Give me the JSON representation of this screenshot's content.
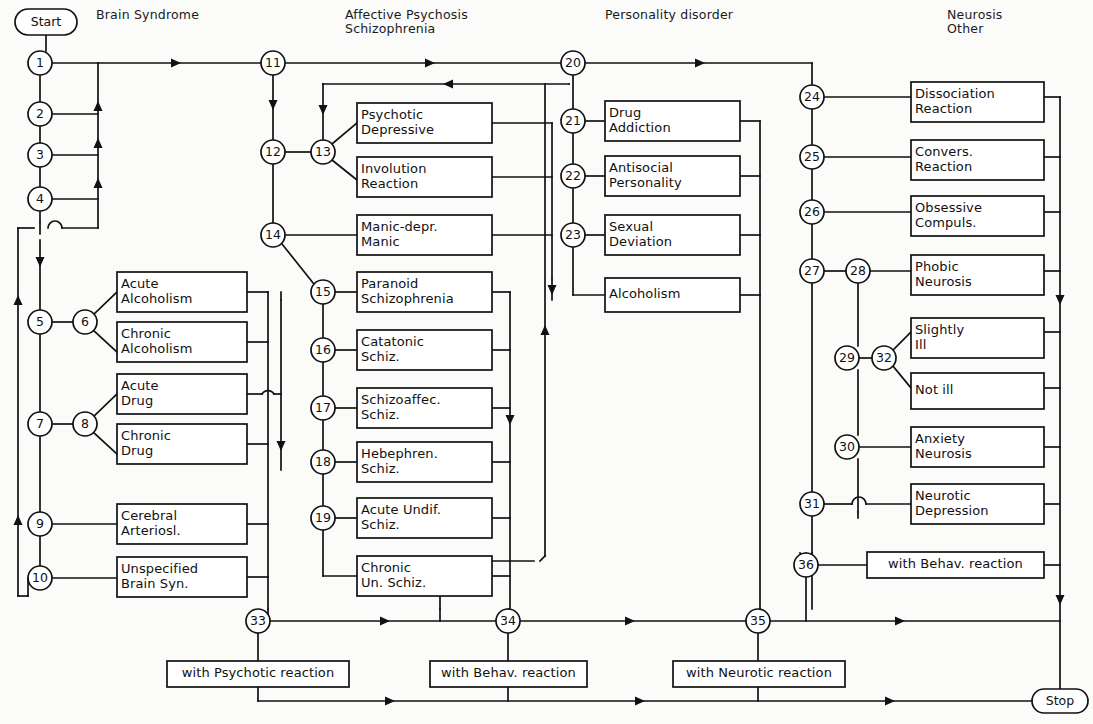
{
  "diagram": {
    "stroke_color": "#111111",
    "background_color": "#fbfbfa",
    "columns": [
      {
        "id": "col-brain-syndrome",
        "label": "Brain Syndrome",
        "x": 96,
        "y": 8
      },
      {
        "id": "col-affective",
        "label": "Affective Psychosis\nSchizophrenia",
        "x": 345,
        "y": 8
      },
      {
        "id": "col-personality",
        "label": "Personality disorder",
        "x": 605,
        "y": 8
      },
      {
        "id": "col-neurosis",
        "label": "Neurosis\nOther",
        "x": 947,
        "y": 8
      }
    ],
    "terminals": [
      {
        "id": "start",
        "label": "Start",
        "cx": 46,
        "cy": 22,
        "rx": 31,
        "ry": 13
      },
      {
        "id": "stop",
        "label": "Stop",
        "cx": 1060,
        "cy": 701,
        "rx": 28,
        "ry": 12
      }
    ],
    "nodes": [
      {
        "id": "n1",
        "label": "1",
        "cx": 40,
        "cy": 63,
        "r": 12
      },
      {
        "id": "n2",
        "label": "2",
        "cx": 40,
        "cy": 114,
        "r": 12
      },
      {
        "id": "n3",
        "label": "3",
        "cx": 40,
        "cy": 155,
        "r": 12
      },
      {
        "id": "n4",
        "label": "4",
        "cx": 40,
        "cy": 199,
        "r": 12
      },
      {
        "id": "n5",
        "label": "5",
        "cx": 40,
        "cy": 322,
        "r": 12
      },
      {
        "id": "n6",
        "label": "6",
        "cx": 85,
        "cy": 322,
        "r": 12
      },
      {
        "id": "n7",
        "label": "7",
        "cx": 40,
        "cy": 424,
        "r": 12
      },
      {
        "id": "n8",
        "label": "8",
        "cx": 85,
        "cy": 424,
        "r": 12
      },
      {
        "id": "n9",
        "label": "9",
        "cx": 40,
        "cy": 524,
        "r": 12
      },
      {
        "id": "n10",
        "label": "10",
        "cx": 40,
        "cy": 578,
        "r": 12
      },
      {
        "id": "n11",
        "label": "11",
        "cx": 273,
        "cy": 63,
        "r": 12
      },
      {
        "id": "n12",
        "label": "12",
        "cx": 273,
        "cy": 152,
        "r": 12
      },
      {
        "id": "n13",
        "label": "13",
        "cx": 323,
        "cy": 152,
        "r": 12
      },
      {
        "id": "n14",
        "label": "14",
        "cx": 273,
        "cy": 235,
        "r": 12
      },
      {
        "id": "n15",
        "label": "15",
        "cx": 323,
        "cy": 292,
        "r": 12
      },
      {
        "id": "n16",
        "label": "16",
        "cx": 323,
        "cy": 350,
        "r": 12
      },
      {
        "id": "n17",
        "label": "17",
        "cx": 323,
        "cy": 408,
        "r": 12
      },
      {
        "id": "n18",
        "label": "18",
        "cx": 323,
        "cy": 462,
        "r": 12
      },
      {
        "id": "n19",
        "label": "19",
        "cx": 323,
        "cy": 518,
        "r": 12
      },
      {
        "id": "n20",
        "label": "20",
        "cx": 573,
        "cy": 63,
        "r": 12
      },
      {
        "id": "n21",
        "label": "21",
        "cx": 573,
        "cy": 121,
        "r": 12
      },
      {
        "id": "n22",
        "label": "22",
        "cx": 573,
        "cy": 176,
        "r": 12
      },
      {
        "id": "n23",
        "label": "23",
        "cx": 573,
        "cy": 235,
        "r": 12
      },
      {
        "id": "n24",
        "label": "24",
        "cx": 812,
        "cy": 97,
        "r": 12
      },
      {
        "id": "n25",
        "label": "25",
        "cx": 812,
        "cy": 157,
        "r": 12
      },
      {
        "id": "n26",
        "label": "26",
        "cx": 812,
        "cy": 212,
        "r": 12
      },
      {
        "id": "n27",
        "label": "27",
        "cx": 812,
        "cy": 271,
        "r": 12
      },
      {
        "id": "n28",
        "label": "28",
        "cx": 858,
        "cy": 271,
        "r": 12
      },
      {
        "id": "n29",
        "label": "29",
        "cx": 847,
        "cy": 358,
        "r": 12
      },
      {
        "id": "n30",
        "label": "30",
        "cx": 847,
        "cy": 447,
        "r": 12
      },
      {
        "id": "n31",
        "label": "31",
        "cx": 812,
        "cy": 504,
        "r": 12
      },
      {
        "id": "n32",
        "label": "32",
        "cx": 884,
        "cy": 358,
        "r": 12
      },
      {
        "id": "n33",
        "label": "33",
        "cx": 258,
        "cy": 621,
        "r": 12
      },
      {
        "id": "n34",
        "label": "34",
        "cx": 508,
        "cy": 621,
        "r": 12
      },
      {
        "id": "n35",
        "label": "35",
        "cx": 758,
        "cy": 621,
        "r": 12
      },
      {
        "id": "n36",
        "label": "36",
        "cx": 806,
        "cy": 565,
        "r": 12
      }
    ],
    "boxes": [
      {
        "id": "box-acute-alcoholism",
        "label": "Acute\nAlcoholism",
        "x": 117,
        "y": 272,
        "w": 130,
        "h": 40,
        "align": "left"
      },
      {
        "id": "box-chronic-alcoholism",
        "label": "Chronic\nAlcoholism",
        "x": 117,
        "y": 322,
        "w": 130,
        "h": 40,
        "align": "left"
      },
      {
        "id": "box-acute-drug",
        "label": "Acute\nDrug",
        "x": 117,
        "y": 374,
        "w": 130,
        "h": 40,
        "align": "left"
      },
      {
        "id": "box-chronic-drug",
        "label": "Chronic\nDrug",
        "x": 117,
        "y": 424,
        "w": 130,
        "h": 40,
        "align": "left"
      },
      {
        "id": "box-cerebral-arteriosl",
        "label": "Cerebral\nArteriosl.",
        "x": 117,
        "y": 504,
        "w": 130,
        "h": 40,
        "align": "left"
      },
      {
        "id": "box-unspecified-brain",
        "label": "Unspecified\nBrain Syn.",
        "x": 117,
        "y": 557,
        "w": 130,
        "h": 40,
        "align": "left"
      },
      {
        "id": "box-psychotic-depressive",
        "label": "Psychotic\nDepressive",
        "x": 357,
        "y": 103,
        "w": 135,
        "h": 40,
        "align": "left"
      },
      {
        "id": "box-involution-reaction",
        "label": "Involution\nReaction",
        "x": 357,
        "y": 157,
        "w": 135,
        "h": 40,
        "align": "left"
      },
      {
        "id": "box-manic-depr-manic",
        "label": "Manic-depr.\nManic",
        "x": 357,
        "y": 215,
        "w": 135,
        "h": 40,
        "align": "left"
      },
      {
        "id": "box-paranoid-schiz",
        "label": "Paranoid\nSchizophrenia",
        "x": 357,
        "y": 272,
        "w": 135,
        "h": 40,
        "align": "left"
      },
      {
        "id": "box-catatonic-schiz",
        "label": "Catatonic\nSchiz.",
        "x": 357,
        "y": 330,
        "w": 135,
        "h": 40,
        "align": "left"
      },
      {
        "id": "box-schizoaffec-schiz",
        "label": "Schizoaffec.\nSchiz.",
        "x": 357,
        "y": 388,
        "w": 135,
        "h": 40,
        "align": "left"
      },
      {
        "id": "box-hebephren-schiz",
        "label": "Hebephren.\nSchiz.",
        "x": 357,
        "y": 442,
        "w": 135,
        "h": 40,
        "align": "left"
      },
      {
        "id": "box-acute-undif-schiz",
        "label": "Acute Undif.\nSchiz.",
        "x": 357,
        "y": 498,
        "w": 135,
        "h": 40,
        "align": "left"
      },
      {
        "id": "box-chronic-un-schiz",
        "label": "Chronic\nUn. Schiz.",
        "x": 357,
        "y": 556,
        "w": 135,
        "h": 40,
        "align": "left"
      },
      {
        "id": "box-drug-addiction",
        "label": "Drug\nAddiction",
        "x": 605,
        "y": 101,
        "w": 135,
        "h": 40,
        "align": "left"
      },
      {
        "id": "box-antisocial-pers",
        "label": "Antisocial\nPersonality",
        "x": 605,
        "y": 156,
        "w": 135,
        "h": 40,
        "align": "left"
      },
      {
        "id": "box-sexual-deviation",
        "label": "Sexual\nDeviation",
        "x": 605,
        "y": 215,
        "w": 135,
        "h": 40,
        "align": "left"
      },
      {
        "id": "box-alcoholism",
        "label": "Alcoholism",
        "x": 605,
        "y": 278,
        "w": 135,
        "h": 34,
        "align": "left"
      },
      {
        "id": "box-dissociation-react",
        "label": "Dissociation\nReaction",
        "x": 911,
        "y": 82,
        "w": 133,
        "h": 40,
        "align": "left"
      },
      {
        "id": "box-convers-reaction",
        "label": "Convers.\nReaction",
        "x": 911,
        "y": 140,
        "w": 133,
        "h": 40,
        "align": "left"
      },
      {
        "id": "box-obsessive-compuls",
        "label": "Obsessive\nCompuls.",
        "x": 911,
        "y": 196,
        "w": 133,
        "h": 40,
        "align": "left"
      },
      {
        "id": "box-phobic-neurosis",
        "label": "Phobic\nNeurosis",
        "x": 911,
        "y": 255,
        "w": 133,
        "h": 40,
        "align": "left"
      },
      {
        "id": "box-slightly-ill",
        "label": "Slightly\nIll",
        "x": 911,
        "y": 318,
        "w": 133,
        "h": 40,
        "align": "left"
      },
      {
        "id": "box-not-ill",
        "label": "Not ill",
        "x": 911,
        "y": 373,
        "w": 133,
        "h": 36,
        "align": "left"
      },
      {
        "id": "box-anxiety-neurosis",
        "label": "Anxiety\nNeurosis",
        "x": 911,
        "y": 427,
        "w": 133,
        "h": 40,
        "align": "left"
      },
      {
        "id": "box-neurotic-depression",
        "label": "Neurotic\nDepression",
        "x": 911,
        "y": 484,
        "w": 133,
        "h": 40,
        "align": "left"
      },
      {
        "id": "box-36-with-behav",
        "label": "with Behav. reaction",
        "x": 867,
        "y": 552,
        "w": 177,
        "h": 26,
        "align": "center"
      },
      {
        "id": "box-33-with-psychotic",
        "label": "with Psychotic reaction",
        "x": 167,
        "y": 661,
        "w": 182,
        "h": 26,
        "align": "center"
      },
      {
        "id": "box-34-with-behav",
        "label": "with Behav. reaction",
        "x": 430,
        "y": 661,
        "w": 157,
        "h": 26,
        "align": "center"
      },
      {
        "id": "box-35-with-neurotic",
        "label": "with Neurotic reaction",
        "x": 673,
        "y": 661,
        "w": 172,
        "h": 26,
        "align": "center"
      }
    ]
  }
}
